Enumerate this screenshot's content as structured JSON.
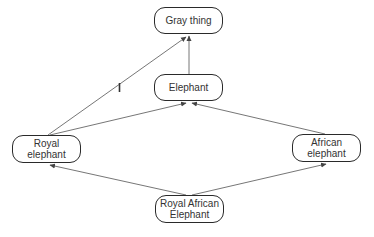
{
  "diagram": {
    "type": "inheritance-graph",
    "nodes": [
      {
        "id": "gray-thing",
        "lines": [
          "Gray thing"
        ],
        "x": 154,
        "y": 7,
        "w": 69,
        "h": 27
      },
      {
        "id": "elephant",
        "lines": [
          "Elephant"
        ],
        "x": 154,
        "y": 74,
        "w": 69,
        "h": 27
      },
      {
        "id": "royal-elephant",
        "lines": [
          "Royal",
          "elephant"
        ],
        "x": 12,
        "y": 135,
        "w": 69,
        "h": 28
      },
      {
        "id": "african-elephant",
        "lines": [
          "African",
          "elephant"
        ],
        "x": 292,
        "y": 134,
        "w": 69,
        "h": 28
      },
      {
        "id": "royal-african-elephant",
        "lines": [
          "Royal African",
          "Elephant"
        ],
        "x": 155,
        "y": 195,
        "w": 69,
        "h": 28
      }
    ],
    "edges": [
      {
        "from": "elephant",
        "to": "gray-thing",
        "cancelled": false
      },
      {
        "from": "royal-elephant",
        "to": "gray-thing",
        "cancelled": true
      },
      {
        "from": "royal-elephant",
        "to": "elephant",
        "cancelled": false
      },
      {
        "from": "african-elephant",
        "to": "elephant",
        "cancelled": false
      },
      {
        "from": "royal-african-elephant",
        "to": "royal-elephant",
        "cancelled": false
      },
      {
        "from": "royal-african-elephant",
        "to": "african-elephant",
        "cancelled": false
      }
    ],
    "colors": {
      "line": "#555555",
      "border": "#2a2a2a",
      "text": "#333333",
      "background": "#ffffff"
    }
  }
}
